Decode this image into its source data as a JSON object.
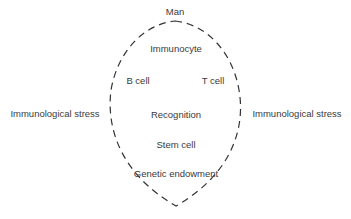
{
  "diagram": {
    "top_label": "Man",
    "inner_labels": {
      "immunocyte": "Immunocyte",
      "b_cell": "B cell",
      "t_cell": "T cell",
      "recognition": "Recognition",
      "stem_cell": "Stem cell",
      "genetic": "Genetic endowment"
    },
    "left_label": "Immunological stress",
    "right_label": "Immunological stress",
    "outline_style": "dashed",
    "outline_color": "#333333"
  }
}
